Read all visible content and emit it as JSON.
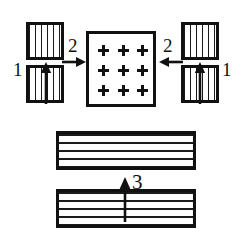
{
  "figure": {
    "type": "technical-line-drawing",
    "background_color": "#ffffff",
    "ink_color": "#111111",
    "callout_labels": [
      {
        "id": "callout-1-left",
        "text": "1"
      },
      {
        "id": "callout-2-left",
        "text": "2"
      },
      {
        "id": "callout-2-right",
        "text": "2"
      },
      {
        "id": "callout-1-right",
        "text": "1"
      },
      {
        "id": "callout-3",
        "text": "3"
      }
    ],
    "parts": {
      "upper_left_block": {
        "hatching": "vertical"
      },
      "lower_left_block": {
        "hatching": "vertical"
      },
      "upper_right_block": {
        "hatching": "vertical"
      },
      "lower_right_block": {
        "hatching": "vertical"
      },
      "center_square": {
        "hatching": "none",
        "marker": "plus",
        "marker_rows": 3,
        "marker_cols": 3,
        "marker_count": 9
      },
      "upper_bar": {
        "hatching": "horizontal"
      },
      "lower_bar": {
        "hatching": "horizontal"
      }
    },
    "arrows": [
      {
        "id": "arrow-left-up",
        "direction": "up",
        "label": "1"
      },
      {
        "id": "arrow-left-right",
        "direction": "right",
        "label": "2"
      },
      {
        "id": "arrow-right-left",
        "direction": "left",
        "label": "2"
      },
      {
        "id": "arrow-right-up",
        "direction": "up",
        "label": "1"
      },
      {
        "id": "arrow-center-bottom",
        "direction": "up",
        "label": "3"
      }
    ]
  }
}
